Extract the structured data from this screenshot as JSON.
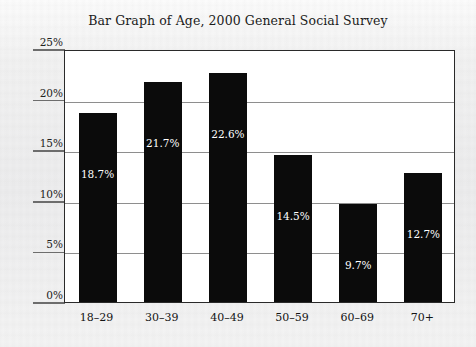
{
  "chart_data": {
    "type": "bar",
    "title": "Bar Graph of Age, 2000 General Social Survey",
    "xlabel": "",
    "ylabel": "",
    "categories": [
      "18–29",
      "30–39",
      "40–49",
      "50–59",
      "60–69",
      "70+"
    ],
    "values": [
      18.7,
      21.7,
      22.6,
      14.5,
      9.7,
      12.7
    ],
    "value_labels": [
      "18.7%",
      "21.7%",
      "22.6%",
      "14.5%",
      "9.7%",
      "12.7%"
    ],
    "ylim": [
      0,
      25
    ],
    "ytick_labels": [
      "0%",
      "5%",
      "10%",
      "15%",
      "20%",
      "25%"
    ],
    "ytick_values": [
      0,
      5,
      10,
      15,
      20,
      25
    ],
    "grid": true,
    "legend": null,
    "bar_color": "#0b0b0b",
    "plot_background": "#ffffff",
    "page_background": "#efefef",
    "gridline_color": "#8e8e8e",
    "axis_color": "#2a2a2a"
  }
}
